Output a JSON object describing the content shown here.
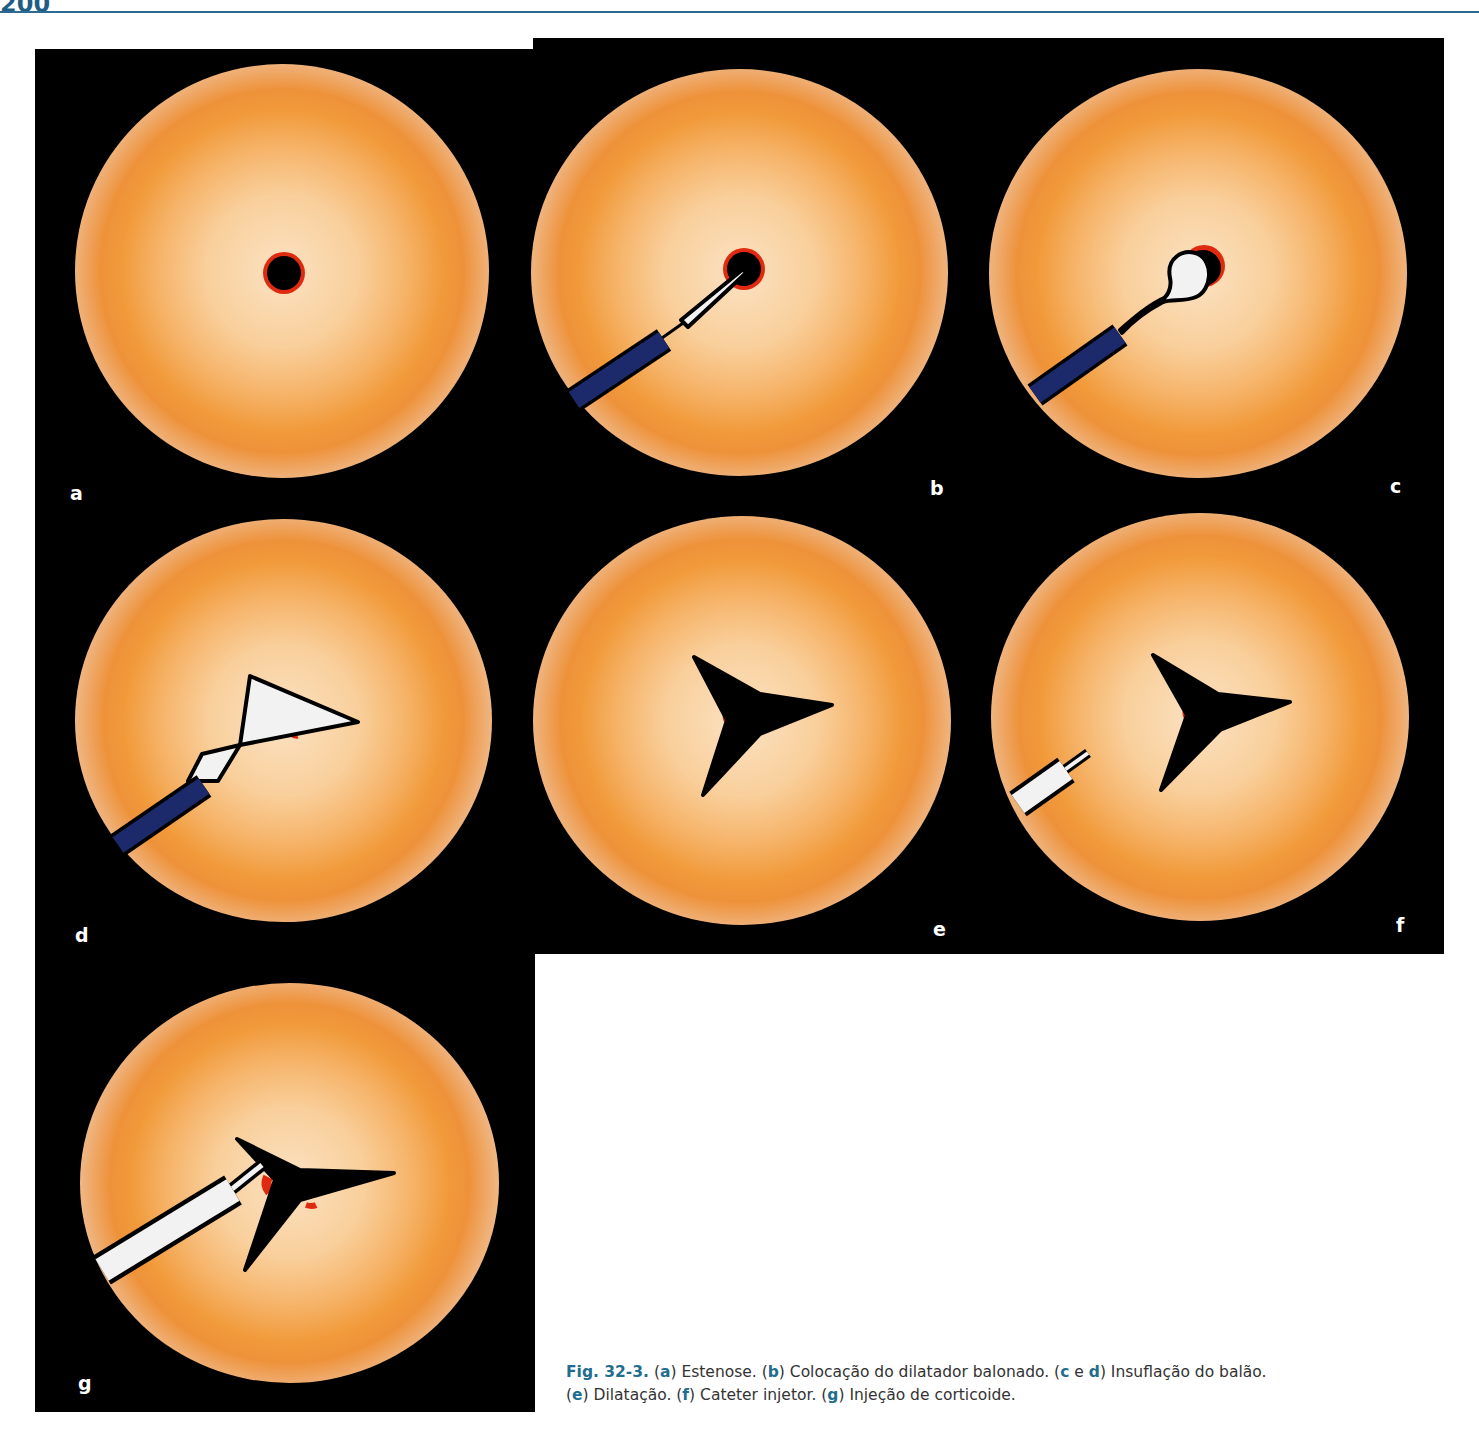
{
  "page": {
    "page_number": "200",
    "header_rule_color": "#2d6a92"
  },
  "figure": {
    "id": "Fig. 32-3.",
    "panels": [
      {
        "label": "a",
        "title": "Estenose"
      },
      {
        "label": "b",
        "title": "Colocação do dilatador balonado"
      },
      {
        "label": "c",
        "title": "Insuflação do balão"
      },
      {
        "label": "d",
        "title": "Insuflação do balão"
      },
      {
        "label": "e",
        "title": "Dilatação"
      },
      {
        "label": "f",
        "title": "Cateter injetor"
      },
      {
        "label": "g",
        "title": "Injeção de corticoide"
      }
    ],
    "colors": {
      "background": "#000000",
      "lumen_orange": "#f19a3a",
      "mucosa_gray": "#d6d6d8",
      "stenosis_rim": "#e02a10",
      "catheter_blue": "#1c2a6b"
    }
  },
  "caption": {
    "fig_label": "Fig. 32-3.",
    "parts": [
      {
        "open": " (",
        "letter": "a",
        "close": ") ",
        "text": "Estenose."
      },
      {
        "open": " (",
        "letter": "b",
        "close": ") ",
        "text": "Colocação do dilatador balonado."
      },
      {
        "open": " (",
        "letter": "c",
        "mid": " e ",
        "letter2": "d",
        "close": ") ",
        "text": "Insuflação do balão."
      },
      {
        "open": " (",
        "letter": "e",
        "close": ") ",
        "text": "Dilatação."
      },
      {
        "open": " (",
        "letter": "f",
        "close": ") ",
        "text": "Cateter injetor."
      },
      {
        "open": " (",
        "letter": "g",
        "close": ") ",
        "text": "Injeção de corticoide."
      }
    ]
  }
}
